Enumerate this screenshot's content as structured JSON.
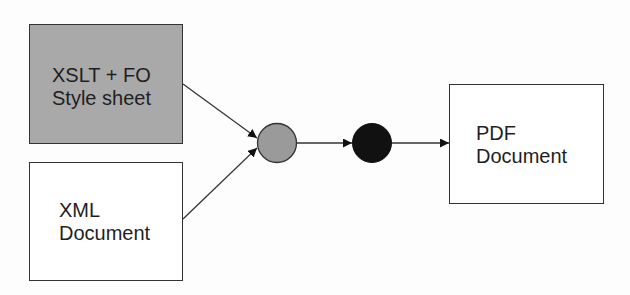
{
  "diagram": {
    "title": "",
    "nodes": [
      {
        "id": "xslt-fo-stylesheet",
        "shape": "rectangle",
        "fill": "#a9a9a9",
        "lines": [
          "XSLT + FO",
          "Style sheet"
        ]
      },
      {
        "id": "xml-document",
        "shape": "rectangle",
        "fill": "#ffffff",
        "lines": [
          "XML",
          "Document"
        ]
      },
      {
        "id": "processor-gray",
        "shape": "circle",
        "fill": "#9a9a9a"
      },
      {
        "id": "processor-black",
        "shape": "circle",
        "fill": "#111111"
      },
      {
        "id": "pdf-document",
        "shape": "rectangle",
        "fill": "#ffffff",
        "lines": [
          "PDF",
          "Document"
        ]
      }
    ],
    "edges": [
      {
        "from": "xslt-fo-stylesheet",
        "to": "processor-gray"
      },
      {
        "from": "xml-document",
        "to": "processor-gray"
      },
      {
        "from": "processor-gray",
        "to": "processor-black"
      },
      {
        "from": "processor-black",
        "to": "pdf-document"
      }
    ]
  },
  "labels": {
    "xslt_line1": "XSLT + FO",
    "xslt_line2": "Style sheet",
    "xml_line1": "XML",
    "xml_line2": "Document",
    "pdf_line1": "PDF",
    "pdf_line2": "Document"
  },
  "colors": {
    "stroke": "#333333",
    "gray_box": "#a9a9a9",
    "gray_circle": "#9a9a9a",
    "black_circle": "#111111"
  }
}
